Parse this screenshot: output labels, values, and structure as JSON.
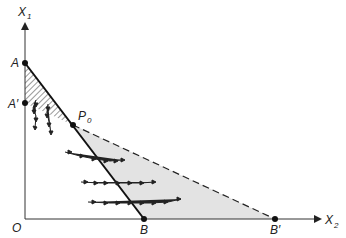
{
  "diagram": {
    "axes": {
      "y_label": "X",
      "y_label_sub": "1",
      "x_label": "X",
      "x_label_sub": "2",
      "origin_label": "O"
    },
    "points": {
      "A": {
        "label": "A",
        "x": 25,
        "y": 63
      },
      "A_prime": {
        "label": "A′",
        "x": 25,
        "y": 103
      },
      "P0": {
        "label": "P",
        "sub": "0",
        "x": 73,
        "y": 125
      },
      "B": {
        "label": "B",
        "x": 144,
        "y": 219
      },
      "B_prime": {
        "label": "B′",
        "x": 275,
        "y": 219
      }
    },
    "regions": {
      "hatched": "triangle A-A'-P0",
      "shaded": "triangle P0-B-B'",
      "shaded_color": "#e3e3e3"
    },
    "lines": {
      "solid": "A to B through P0",
      "dashed": "P0 to B'"
    },
    "flow_paths": {
      "downward": 2,
      "rightward": 3
    }
  }
}
